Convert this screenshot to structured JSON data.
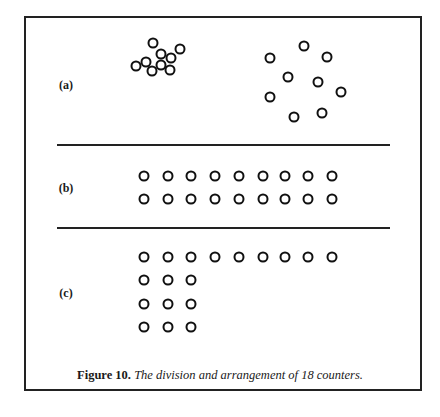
{
  "figure": {
    "number_label": "Figure 10.",
    "caption_text": "The division and arrangement of 18 counters.",
    "total_counters": 18,
    "panels": [
      {
        "id": "a",
        "label": "(a)",
        "label_pos": [
          66,
          85
        ],
        "description": "Two scattered groups of 9 counters each",
        "counters": [
          [
            153,
            43
          ],
          [
            161,
            54
          ],
          [
            180,
            49
          ],
          [
            171,
            58
          ],
          [
            136,
            66
          ],
          [
            146,
            62
          ],
          [
            152,
            71
          ],
          [
            161,
            65
          ],
          [
            170,
            70
          ],
          [
            304,
            46
          ],
          [
            270,
            58
          ],
          [
            327,
            57
          ],
          [
            288,
            77
          ],
          [
            318,
            82
          ],
          [
            341,
            92
          ],
          [
            270,
            97
          ],
          [
            294,
            117
          ],
          [
            322,
            113
          ]
        ]
      },
      {
        "id": "b",
        "label": "(b)",
        "label_pos": [
          66,
          188
        ],
        "description": "Two rows of 9 counters",
        "rows_y": [
          176,
          199
        ],
        "cols_x": [
          144,
          168,
          191,
          215,
          239,
          263,
          285,
          308,
          332
        ]
      },
      {
        "id": "c",
        "label": "(c)",
        "label_pos": [
          66,
          293
        ],
        "description": "One row of 9 counters and a 3x3 block of 9 counters",
        "row1_y": 257,
        "row1_x": [
          144,
          168,
          191,
          215,
          239,
          263,
          285,
          308,
          332
        ],
        "block_y": [
          280,
          304,
          327
        ],
        "block_x": [
          144,
          168,
          191
        ]
      }
    ],
    "dividers_y": [
      144,
      227
    ]
  }
}
